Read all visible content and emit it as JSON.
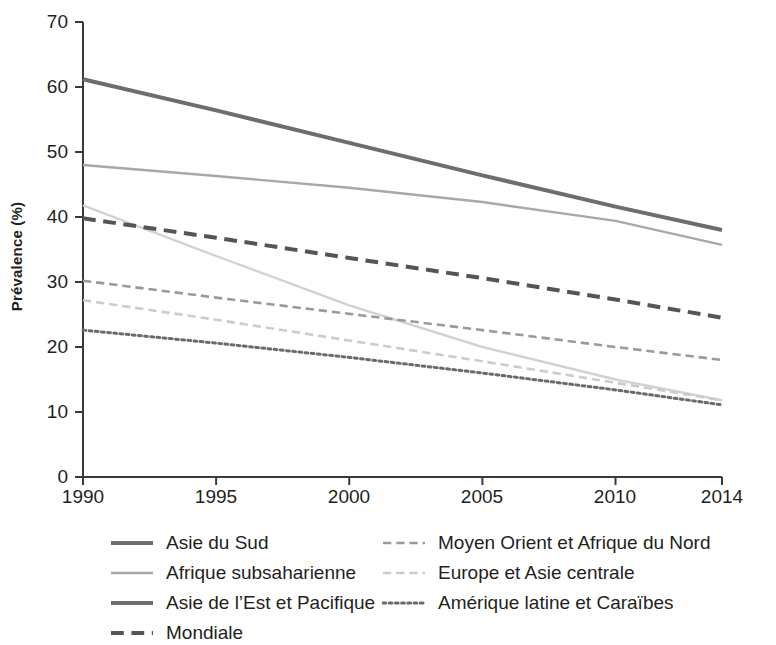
{
  "chart_data": {
    "type": "line",
    "title": "",
    "xlabel": "",
    "ylabel": "Prévalence (%)",
    "xlim": [
      1990,
      2014
    ],
    "ylim": [
      0,
      70
    ],
    "grid": false,
    "legend_position": "bottom",
    "x": [
      1990,
      1995,
      2000,
      2005,
      2010,
      2014
    ],
    "xticklabels": [
      "1990",
      "1995",
      "2000",
      "2005",
      "2010",
      "2014"
    ],
    "yticklabels": [
      "0",
      "10",
      "20",
      "30",
      "40",
      "50",
      "60",
      "70"
    ],
    "yticks": [
      0,
      10,
      20,
      30,
      40,
      50,
      60,
      70
    ],
    "series": [
      {
        "name": "Asie du Sud",
        "color": "#6d6d6d",
        "style": "solid",
        "width": 4,
        "x": [
          1990,
          1995,
          2000,
          2005,
          2010,
          2014
        ],
        "values": [
          61.2,
          56.4,
          51.4,
          46.4,
          41.6,
          38.0
        ]
      },
      {
        "name": "Afrique subsaharienne",
        "color": "#a8a8a8",
        "style": "solid",
        "width": 2.4,
        "x": [
          1990,
          1995,
          2000,
          2005,
          2010,
          2014
        ],
        "values": [
          48.0,
          46.3,
          44.5,
          42.3,
          39.4,
          35.7
        ]
      },
      {
        "name": "Asie de l'Est et Pacifique",
        "color": "#d2d2d2",
        "style": "solid",
        "width": 2.4,
        "x": [
          1990,
          1995,
          2000,
          2005,
          2010,
          2014
        ],
        "values": [
          41.8,
          34.0,
          26.4,
          20.0,
          15.0,
          11.8
        ]
      },
      {
        "name": "Mondiale",
        "color": "#555555",
        "style": "dashed",
        "width": 4,
        "x": [
          1990,
          1995,
          2000,
          2005,
          2010,
          2014
        ],
        "values": [
          39.8,
          36.8,
          33.7,
          30.6,
          27.3,
          24.5
        ]
      },
      {
        "name": "Moyen Orient et Afrique du Nord",
        "color": "#9a9a9a",
        "style": "dashed",
        "width": 2.6,
        "x": [
          1990,
          1995,
          2000,
          2005,
          2010,
          2014
        ],
        "values": [
          30.2,
          27.6,
          25.1,
          22.6,
          20.0,
          18.0
        ]
      },
      {
        "name": "Europe et Asie centrale",
        "color": "#cccccc",
        "style": "dashed",
        "width": 2.6,
        "x": [
          1990,
          1995,
          2000,
          2005,
          2010,
          2014
        ],
        "values": [
          27.2,
          24.2,
          21.0,
          17.8,
          14.5,
          11.8
        ]
      },
      {
        "name": "Amérique latine et Caraïbes",
        "color": "#6b6b6b",
        "style": "dotted",
        "width": 3,
        "x": [
          1990,
          1995,
          2000,
          2005,
          2010,
          2014
        ],
        "values": [
          22.6,
          20.6,
          18.4,
          16.0,
          13.4,
          11.1
        ]
      }
    ]
  },
  "axes": {
    "ylabel": "Prévalence (%)",
    "ytick_0": "0",
    "ytick_10": "10",
    "ytick_20": "20",
    "ytick_30": "30",
    "ytick_40": "40",
    "ytick_50": "50",
    "ytick_60": "60",
    "ytick_70": "70",
    "xtick_1990": "1990",
    "xtick_1995": "1995",
    "xtick_2000": "2000",
    "xtick_2005": "2005",
    "xtick_2010": "2010",
    "xtick_2014": "2014"
  },
  "legend": {
    "left": [
      {
        "label": "Asie du Sud"
      },
      {
        "label": "Afrique subsaharienne"
      },
      {
        "label": "Asie de l’Est et Pacifique"
      },
      {
        "label": "Mondiale"
      }
    ],
    "right": [
      {
        "label": "Moyen Orient et Afrique du Nord"
      },
      {
        "label": "Europe et Asie centrale"
      },
      {
        "label": "Amérique latine et Caraïbes"
      }
    ]
  }
}
